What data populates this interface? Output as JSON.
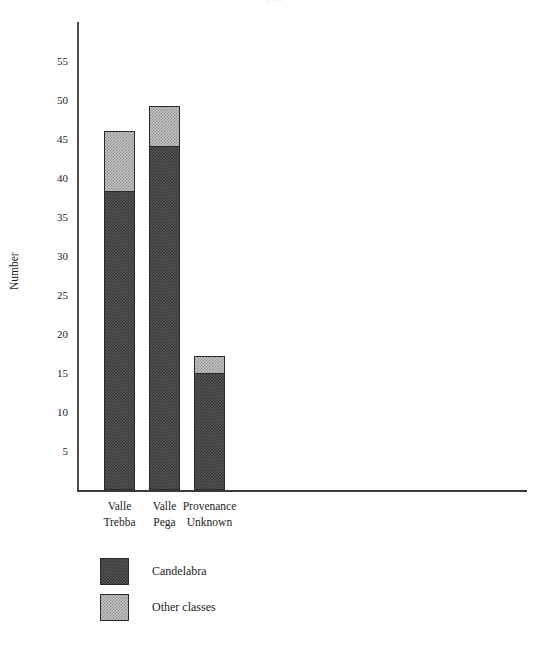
{
  "figure": {
    "caption_remnant": "·  ·   ·"
  },
  "chart_data": {
    "type": "bar",
    "stacked": true,
    "title": "",
    "subtitle": "",
    "xlabel": "",
    "ylabel": "Number",
    "categories": [
      "Valle Trebba",
      "Valle Pega",
      "Provenance Unknown"
    ],
    "category_lines": [
      [
        "Valle",
        "Trebba"
      ],
      [
        "Valle",
        "Pega"
      ],
      [
        "Provenance",
        "Unknown"
      ]
    ],
    "series": [
      {
        "name": "Candelabra",
        "color": "#4a4a4a",
        "values": [
          38.3,
          44.1,
          15.0
        ]
      },
      {
        "name": "Other classes",
        "color": "#a8a8a8",
        "values": [
          7.9,
          5.2,
          2.3
        ]
      }
    ],
    "totals": [
      46.2,
      49.3,
      17.3
    ],
    "ylim": [
      0,
      60
    ],
    "yticks": [
      5,
      10,
      15,
      20,
      25,
      30,
      35,
      40,
      45,
      50,
      55
    ],
    "ytick_labels": [
      "5",
      "10",
      "15",
      "20",
      "25",
      "30",
      "35",
      "40",
      "45",
      "50",
      "55"
    ],
    "grid": false,
    "legend_position": "bottom-left",
    "legend": [
      {
        "label": "Candelabra",
        "swatch": "dark-hatch"
      },
      {
        "label": "Other classes",
        "swatch": "light-hatch"
      }
    ]
  },
  "axes": {
    "y_axis_title": "Number"
  }
}
